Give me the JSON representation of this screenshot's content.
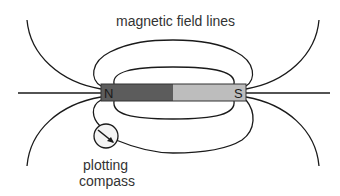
{
  "diagram": {
    "title_label": "magnetic field lines",
    "magnet": {
      "north_label": "N",
      "south_label": "S",
      "north_color": "#5c5c5c",
      "south_color": "#bdbdbd",
      "outline_color": "#333333"
    },
    "compass_label_line1": "plotting",
    "compass_label_line2": "compass",
    "line_color": "#1a1a1a"
  }
}
